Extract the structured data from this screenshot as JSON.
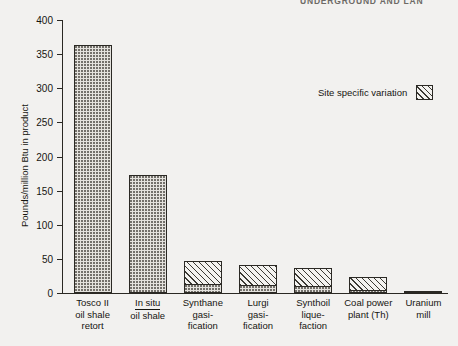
{
  "running_head": "UNDERGROUND AND LAN",
  "chart_data": {
    "type": "bar",
    "title": "",
    "xlabel": "",
    "ylabel": "Pounds/million Btu in product",
    "ylim": [
      0,
      400
    ],
    "yticks": [
      0,
      50,
      100,
      150,
      200,
      250,
      300,
      350,
      400
    ],
    "grid": false,
    "categories": [
      "Tosco II oil shale retort",
      "In situ oil shale",
      "Synthane gasification",
      "Lurgi gasification",
      "Synthoil liquefaction",
      "Coal power plant (Th)",
      "Uranium mill"
    ],
    "category_label_lines": [
      [
        "Tosco II",
        "oil shale",
        "retort"
      ],
      [
        "In situ",
        "oil shale"
      ],
      [
        "Synthane",
        "gasi-",
        "fication"
      ],
      [
        "Lurgi",
        "gasi-",
        "fication"
      ],
      [
        "Synthoil",
        "lique-",
        "faction"
      ],
      [
        "Coal power",
        "plant (Th)"
      ],
      [
        "Uranium",
        "mill"
      ]
    ],
    "series": [
      {
        "name": "Base value",
        "values": [
          363,
          173,
          13,
          12,
          11,
          5,
          3
        ]
      },
      {
        "name": "Site specific variation",
        "values": [
          0,
          0,
          34,
          29,
          26,
          19,
          0
        ]
      }
    ],
    "totals": [
      363,
      173,
      47,
      41,
      37,
      24,
      3
    ],
    "legend": {
      "position": "upper right",
      "entries": [
        {
          "label": "Site specific variation",
          "pattern": "diagonal-hatch"
        }
      ]
    }
  },
  "colors": {
    "background": "#f2f1ef",
    "axis": "#2a2823",
    "text": "#16150f",
    "base_fill": "#e4e2dd",
    "hatch": "#3b3933"
  }
}
